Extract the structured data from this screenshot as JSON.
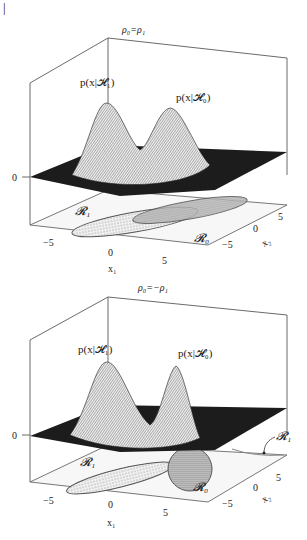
{
  "page_marker": "|",
  "panels": [
    {
      "title": "ρ₀=ρ₁",
      "label_h1": "p(x|𝓗₁)",
      "label_h0": "p(x|𝓗₀)",
      "z_tick": "0",
      "x1_ticks": [
        "−5",
        "0",
        "5"
      ],
      "x2_ticks": [
        "5",
        "0",
        "−5"
      ],
      "x1_label": "x₁",
      "x2_label": "x₂",
      "region_r1": "𝓡₁",
      "region_r0": "𝓡₀"
    },
    {
      "title": "ρ₀=−ρ₁",
      "label_h1": "p(x|𝓗₁)",
      "label_h0": "p(x|𝓗₀)",
      "z_tick": "0",
      "x1_ticks": [
        "−5",
        "0",
        "5"
      ],
      "x2_ticks": [
        "5",
        "0",
        "−5"
      ],
      "x1_label": "x₁",
      "x2_label": "x₂",
      "region_r1": "𝓡₁",
      "region_r0": "𝓡₀",
      "region_r1_callout": "𝓡₁"
    }
  ],
  "colors": {
    "line": "#444444",
    "surface_dark": "#1c1c1c",
    "mesh_light": "#f2f2f2",
    "floor": "#f7f7f7"
  }
}
